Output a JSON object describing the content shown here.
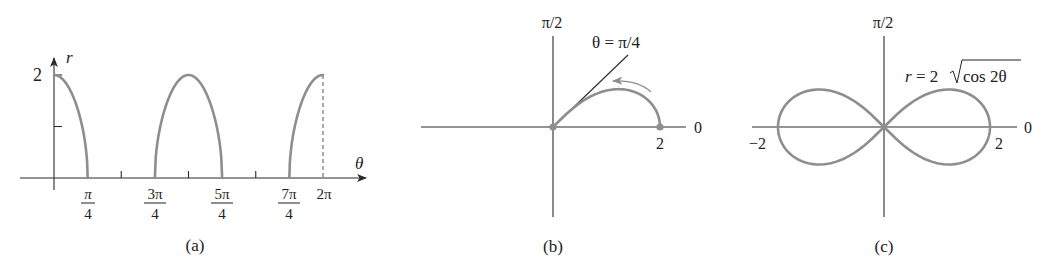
{
  "chart_data": [
    {
      "id": "a",
      "type": "line",
      "caption": "(a)",
      "title": "",
      "xlabel": "θ",
      "ylabel": "r",
      "function": "r = 2√cos 2θ (Cartesian r vs θ)",
      "x_ticks": [
        {
          "value": "π/4",
          "num": "π",
          "den": "4"
        },
        {
          "value": "π/2",
          "num": "",
          "den": ""
        },
        {
          "value": "3π/4",
          "num": "3π",
          "den": "4"
        },
        {
          "value": "π",
          "num": "",
          "den": ""
        },
        {
          "value": "5π/4",
          "num": "5π",
          "den": "4"
        },
        {
          "value": "3π/2",
          "num": "",
          "den": ""
        },
        {
          "value": "7π/4",
          "num": "7π",
          "den": "4"
        },
        {
          "value": "2π",
          "label": "2π"
        }
      ],
      "y_ticks": [
        {
          "value": 1,
          "label": ""
        },
        {
          "value": 2,
          "label": "2"
        }
      ],
      "xlim": [
        0,
        6.2832
      ],
      "ylim": [
        0,
        2
      ],
      "series": [
        {
          "name": "arc-1",
          "domain": [
            0,
            0.7854
          ],
          "x": [
            0,
            0.2,
            0.4,
            0.6,
            0.7,
            0.7854
          ],
          "y": [
            2.0,
            1.92,
            1.68,
            1.19,
            0.77,
            0.0
          ]
        },
        {
          "name": "arc-2",
          "domain": [
            2.3562,
            3.927
          ],
          "x": [
            2.3562,
            2.6,
            2.9,
            3.1416,
            3.4,
            3.7,
            3.927
          ],
          "y": [
            0.0,
            1.36,
            1.86,
            2.0,
            1.86,
            1.36,
            0.0
          ]
        },
        {
          "name": "arc-3",
          "domain": [
            5.4978,
            6.2832
          ],
          "x": [
            5.4978,
            5.6,
            5.8,
            6.0,
            6.2832
          ],
          "y": [
            0.0,
            1.1,
            1.6,
            1.92,
            2.0
          ]
        }
      ],
      "annotations": [
        "dashed vertical line at θ = 2π from r = 0 to r = 2"
      ]
    },
    {
      "id": "b",
      "type": "line",
      "caption": "(b)",
      "projection": "polar",
      "function": "r = 2√cos 2θ, 0 ≤ θ ≤ π/4",
      "axis_labels": {
        "polar_axis": "0",
        "vertical_axis": "π/2"
      },
      "point_labels": [
        "2"
      ],
      "annotation": "θ = π/4",
      "theta": [
        0,
        0.1,
        0.2,
        0.3,
        0.4,
        0.5,
        0.6,
        0.7,
        0.7854
      ],
      "r": [
        2.0,
        1.98,
        1.92,
        1.81,
        1.68,
        1.47,
        1.19,
        0.77,
        0.0
      ],
      "markers": [
        {
          "r": 0,
          "theta": 0
        },
        {
          "r": 2,
          "theta": 0
        }
      ],
      "arrow": "counter-clockwise direction of increasing θ"
    },
    {
      "id": "c",
      "type": "line",
      "caption": "(c)",
      "projection": "polar",
      "function": "r = 2√cos 2θ",
      "formula_label": "r = 2√cos 2θ",
      "axis_labels": {
        "polar_axis": "0",
        "vertical_axis": "π/2"
      },
      "point_labels": [
        "−2",
        "2"
      ],
      "shape": "lemniscate",
      "extent_x": [
        -2,
        2
      ],
      "max_abs_y": 0.707
    }
  ],
  "panel_a": {
    "y_axis_label": "r",
    "x_axis_label": "θ",
    "y_tick_label": "2",
    "x_labels": [
      {
        "num": "π",
        "den": "4"
      },
      {
        "num": "3π",
        "den": "4"
      },
      {
        "num": "5π",
        "den": "4"
      },
      {
        "num": "7π",
        "den": "4"
      }
    ],
    "x_label_2pi": "2π",
    "caption": "(a)"
  },
  "panel_b": {
    "top_label": "π/2",
    "right_label": "0",
    "point_label": "2",
    "line_label": "θ = π/4",
    "caption": "(b)"
  },
  "panel_c": {
    "top_label": "π/2",
    "right_label": "0",
    "left_point_label": "−2",
    "right_point_label": "2",
    "formula_prefix": "r = 2",
    "formula_radicand": "cos 2θ",
    "caption": "(c)"
  },
  "colors": {
    "curve": "#8e8e8e",
    "axis": "#2a2a2a",
    "text": "#222222"
  }
}
